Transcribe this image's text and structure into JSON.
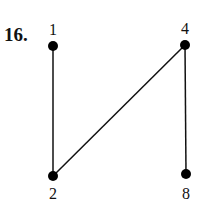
{
  "problem_number": "16.",
  "diagram": {
    "type": "hasse-diagram",
    "nodes": [
      {
        "id": "1",
        "label": "1",
        "x": 53,
        "y": 46,
        "label_pos": "above"
      },
      {
        "id": "4",
        "label": "4",
        "x": 185,
        "y": 45,
        "label_pos": "above"
      },
      {
        "id": "2",
        "label": "2",
        "x": 53,
        "y": 176,
        "label_pos": "below"
      },
      {
        "id": "8",
        "label": "8",
        "x": 186,
        "y": 174,
        "label_pos": "below"
      }
    ],
    "edges": [
      {
        "from": "1",
        "to": "2"
      },
      {
        "from": "2",
        "to": "4"
      },
      {
        "from": "4",
        "to": "8"
      }
    ],
    "colors": {
      "line": "#111111",
      "node": "#000000"
    }
  }
}
